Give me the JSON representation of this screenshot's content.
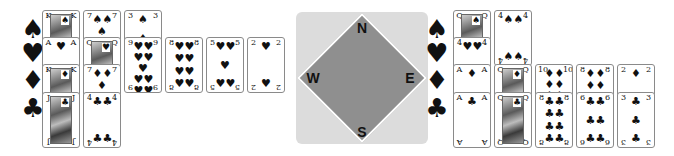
{
  "compass": {
    "north": "N",
    "east": "E",
    "south": "S",
    "west": "W",
    "colors": {
      "outer": "#dcdcdc",
      "diamond": "#8f8f8f"
    }
  },
  "left_hand": {
    "suits": [
      {
        "symbol": "♠",
        "name": "spades",
        "cards": [
          "K",
          "7",
          "3"
        ]
      },
      {
        "symbol": "♥",
        "name": "hearts",
        "cards": [
          "A",
          "Q",
          "9",
          "8",
          "5",
          "2"
        ]
      },
      {
        "symbol": "♦",
        "name": "diamonds",
        "cards": [
          "K",
          "7"
        ]
      },
      {
        "symbol": "♣",
        "name": "clubs",
        "cards": [
          "J",
          "4"
        ]
      }
    ]
  },
  "right_hand": {
    "suits": [
      {
        "symbol": "♠",
        "name": "spades",
        "cards": [
          "Q",
          "4"
        ]
      },
      {
        "symbol": "♥",
        "name": "hearts",
        "cards": [
          "4"
        ]
      },
      {
        "symbol": "♦",
        "name": "diamonds",
        "cards": [
          "A",
          "Q",
          "10",
          "8",
          "2"
        ]
      },
      {
        "symbol": "♣",
        "name": "clubs",
        "cards": [
          "A",
          "Q",
          "8",
          "6",
          "3"
        ]
      }
    ]
  }
}
